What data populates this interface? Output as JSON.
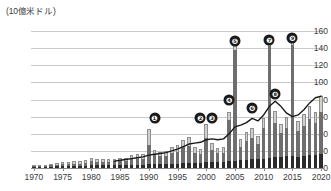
{
  "chart_data": {
    "type": "bar",
    "title": "",
    "subtitle": "",
    "unit_label": "(10億米ドル)",
    "ylabel": "",
    "xlabel": "",
    "ylim": [
      0,
      160
    ],
    "ytick_step": 20,
    "yticks": [
      0,
      20,
      40,
      60,
      80,
      100,
      120,
      140,
      160
    ],
    "grid": true,
    "legend_position": "none",
    "xlim": [
      1970,
      2020
    ],
    "xticks": [
      1970,
      1975,
      1980,
      1985,
      1990,
      1995,
      2000,
      2005,
      2010,
      2015,
      2020
    ],
    "categories": [
      1970,
      1971,
      1972,
      1973,
      1974,
      1975,
      1976,
      1977,
      1978,
      1979,
      1980,
      1981,
      1982,
      1983,
      1984,
      1985,
      1986,
      1987,
      1988,
      1989,
      1990,
      1991,
      1992,
      1993,
      1994,
      1995,
      1996,
      1997,
      1998,
      1999,
      2000,
      2001,
      2002,
      2003,
      2004,
      2005,
      2006,
      2007,
      2008,
      2009,
      2010,
      2011,
      2012,
      2013,
      2014,
      2015,
      2016,
      2017,
      2018,
      2019,
      2020
    ],
    "series": [
      {
        "name": "segment-lower",
        "color": "#2b2b2b",
        "values": [
          1,
          1,
          1,
          1,
          2,
          2,
          2,
          2,
          2,
          2,
          3,
          3,
          3,
          3,
          3,
          3,
          3,
          4,
          4,
          4,
          5,
          5,
          5,
          5,
          5,
          5,
          6,
          6,
          6,
          6,
          7,
          7,
          7,
          7,
          8,
          8,
          9,
          9,
          10,
          10,
          11,
          12,
          13,
          13,
          14,
          14,
          13,
          14,
          15,
          15,
          16
        ]
      },
      {
        "name": "segment-middle",
        "color": "#6e6e6e",
        "values": [
          1,
          1,
          2,
          2,
          2,
          3,
          3,
          3,
          3,
          4,
          5,
          4,
          4,
          4,
          5,
          5,
          5,
          7,
          7,
          7,
          22,
          10,
          9,
          9,
          12,
          14,
          18,
          20,
          12,
          10,
          28,
          14,
          10,
          11,
          48,
          130,
          16,
          22,
          25,
          18,
          36,
          130,
          40,
          28,
          33,
          130,
          30,
          35,
          42,
          38,
          50
        ]
      },
      {
        "name": "segment-upper",
        "color": "#cfcfcf",
        "values": [
          1,
          1,
          1,
          2,
          2,
          2,
          2,
          3,
          3,
          3,
          4,
          3,
          3,
          3,
          3,
          4,
          4,
          4,
          5,
          5,
          19,
          6,
          5,
          6,
          7,
          8,
          9,
          10,
          7,
          6,
          17,
          8,
          6,
          7,
          10,
          9,
          9,
          11,
          12,
          9,
          12,
          10,
          14,
          11,
          13,
          10,
          12,
          14,
          16,
          12,
          18
        ]
      }
    ],
    "trend_line": {
      "name": "trend",
      "color": "#1a1a1a",
      "start_year": 1984,
      "values": [
        [
          1984,
          8
        ],
        [
          1985,
          9
        ],
        [
          1986,
          10
        ],
        [
          1987,
          11
        ],
        [
          1988,
          12
        ],
        [
          1989,
          13
        ],
        [
          1990,
          15
        ],
        [
          1991,
          16
        ],
        [
          1992,
          17
        ],
        [
          1993,
          18
        ],
        [
          1994,
          20
        ],
        [
          1995,
          22
        ],
        [
          1996,
          25
        ],
        [
          1997,
          28
        ],
        [
          1998,
          29
        ],
        [
          1999,
          30
        ],
        [
          2000,
          33
        ],
        [
          2001,
          34
        ],
        [
          2002,
          33
        ],
        [
          2003,
          34
        ],
        [
          2004,
          40
        ],
        [
          2005,
          48
        ],
        [
          2006,
          50
        ],
        [
          2007,
          53
        ],
        [
          2008,
          58
        ],
        [
          2009,
          55
        ],
        [
          2010,
          62
        ],
        [
          2011,
          72
        ],
        [
          2012,
          78
        ],
        [
          2013,
          72
        ],
        [
          2014,
          64
        ],
        [
          2015,
          60
        ],
        [
          2016,
          62
        ],
        [
          2017,
          68
        ],
        [
          2018,
          76
        ],
        [
          2019,
          82
        ],
        [
          2020,
          84
        ]
      ]
    },
    "markers": [
      {
        "id": "1",
        "label": "❶",
        "year": 1991,
        "value": 58
      },
      {
        "id": "2",
        "label": "❷",
        "year": 1999,
        "value": 58
      },
      {
        "id": "3",
        "label": "❸",
        "year": 2001,
        "value": 58
      },
      {
        "id": "4",
        "label": "❹",
        "year": 2004,
        "value": 80
      },
      {
        "id": "5",
        "label": "❺",
        "year": 2005,
        "value": 148
      },
      {
        "id": "6",
        "label": "❻",
        "year": 2008,
        "value": 70
      },
      {
        "id": "7",
        "label": "❼",
        "year": 2011,
        "value": 150
      },
      {
        "id": "8",
        "label": "❽",
        "year": 2012,
        "value": 87
      },
      {
        "id": "9",
        "label": "❾",
        "year": 2015,
        "value": 152
      }
    ]
  },
  "colors": {
    "background": "#ffffff",
    "grid": "#c9c9c9",
    "axis": "#8a8a8a",
    "text": "#3b3b3b",
    "marker_bg": "#1a1a1a",
    "marker_fg": "#ffffff"
  }
}
